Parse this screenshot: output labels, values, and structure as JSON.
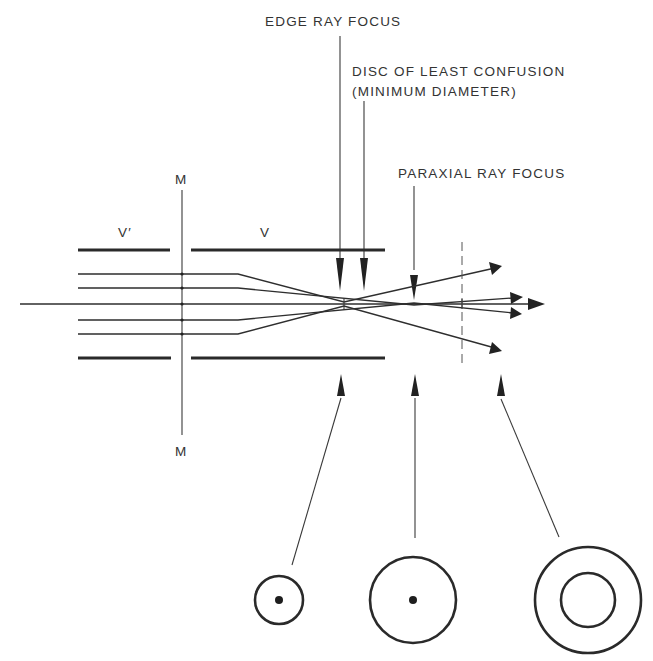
{
  "labels": {
    "edge_ray_focus": "EDGE RAY FOCUS",
    "disc_line1": "DISC OF LEAST CONFUSION",
    "disc_line2": "(MINIMUM DIAMETER)",
    "paraxial_ray_focus": "PARAXIAL RAY FOCUS",
    "v_prime": "V′",
    "v": "V",
    "m_top": "M",
    "m_bottom": "M"
  },
  "colors": {
    "ink": "#2a2a2a",
    "background": "#ffffff"
  },
  "elements": {
    "mirror_plane": "M",
    "aperture_left": "V′",
    "aperture_right": "V",
    "cross_sections": [
      {
        "position": "edge-ray-focus",
        "shape": "small ring with central dot"
      },
      {
        "position": "paraxial-ray-focus",
        "shape": "larger ring with central dot"
      },
      {
        "position": "beyond-paraxial-focus",
        "shape": "double concentric rings"
      }
    ]
  }
}
